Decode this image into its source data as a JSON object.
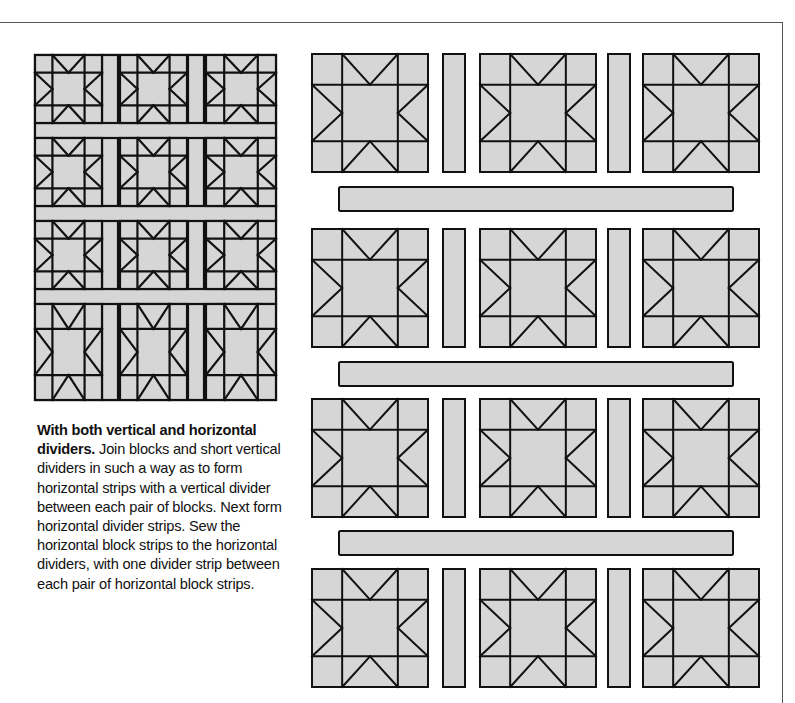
{
  "caption": {
    "title": "With both vertical and horizontal dividers.",
    "body": "Join blocks and short vertical dividers in such a way as to form horizontal strips with a vertical divider between each pair of blocks. Next form horizontal divider strips. Sew the horizontal block strips to the horizontal dividers, with one divider strip between each pair of horizontal block strips."
  },
  "colors": {
    "fill": "#d6d6d6",
    "stroke": "#111111",
    "frame": "#555555"
  },
  "mini_quilt": {
    "label": "finished quilt with vertical and horizontal dividers",
    "rows": 4,
    "cols": 3,
    "block_pattern": "sawtooth-star"
  },
  "assembly": {
    "label": "exploded assembly diagram",
    "block_rows": 4,
    "blocks_per_row": 3,
    "vertical_dividers_per_row": 2,
    "horizontal_dividers": 3,
    "block_pattern": "sawtooth-star"
  }
}
